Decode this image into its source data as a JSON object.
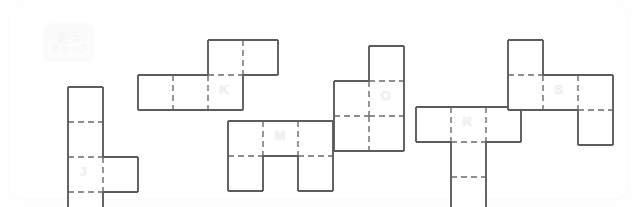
{
  "app": {
    "title": "Cube Net Puzzle Board",
    "background_color": "#ffffff",
    "panel_color": "#ffffff"
  },
  "logo": {
    "name": "logo-badge",
    "line1": "使う",
    "line2": "キューブ",
    "background_color": "#fbfbfb",
    "text_color": "#f6f6f6"
  },
  "style": {
    "cell_size": 35,
    "outline_color": "#5c5c5c",
    "grid_color": "#6b6b6b",
    "cell_fill": "#ffffff",
    "label_color": "#f2f2f2"
  },
  "nets": [
    {
      "id": "net-j",
      "label": "J",
      "x": 56,
      "y": 79,
      "cols": 2,
      "rows": 4,
      "cells": [
        [
          0,
          0
        ],
        [
          0,
          1
        ],
        [
          0,
          2
        ],
        [
          1,
          2
        ],
        [
          0,
          3
        ]
      ],
      "label_cell": [
        0,
        2
      ]
    },
    {
      "id": "net-k",
      "label": "K",
      "x": 126,
      "y": 32,
      "cols": 4,
      "rows": 2,
      "cells": [
        [
          2,
          0
        ],
        [
          3,
          0
        ],
        [
          0,
          1
        ],
        [
          1,
          1
        ],
        [
          2,
          1
        ]
      ],
      "label_cell": [
        2,
        1
      ]
    },
    {
      "id": "net-m",
      "label": "M",
      "x": 216,
      "y": 113,
      "cols": 3,
      "rows": 2,
      "cells": [
        [
          0,
          0
        ],
        [
          1,
          0
        ],
        [
          2,
          0
        ],
        [
          0,
          1
        ],
        [
          2,
          1
        ]
      ],
      "label_cell": [
        1,
        0
      ]
    },
    {
      "id": "net-o",
      "label": "O",
      "x": 322,
      "y": 38,
      "cols": 2,
      "rows": 3,
      "cells": [
        [
          1,
          0
        ],
        [
          0,
          1
        ],
        [
          1,
          1
        ],
        [
          0,
          2
        ],
        [
          1,
          2
        ]
      ],
      "label_cell": [
        1,
        1
      ]
    },
    {
      "id": "net-r",
      "label": "R",
      "x": 404,
      "y": 99,
      "cols": 3,
      "rows": 3,
      "cells": [
        [
          0,
          0
        ],
        [
          1,
          0
        ],
        [
          2,
          0
        ],
        [
          1,
          1
        ],
        [
          1,
          2
        ]
      ],
      "label_cell": [
        1,
        0
      ]
    },
    {
      "id": "net-s",
      "label": "S",
      "x": 496,
      "y": 32,
      "cols": 3,
      "rows": 3,
      "cells": [
        [
          0,
          0
        ],
        [
          0,
          1
        ],
        [
          1,
          1
        ],
        [
          2,
          1
        ],
        [
          2,
          2
        ]
      ],
      "label_cell": [
        1,
        1
      ]
    }
  ]
}
